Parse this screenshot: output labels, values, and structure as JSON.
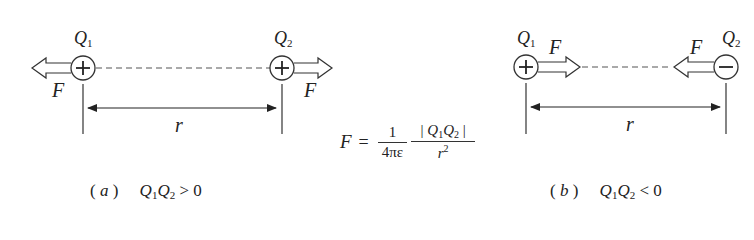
{
  "figure": {
    "panel_a": {
      "caption_label": "a",
      "condition_lhs": "Q",
      "condition_op": ">",
      "condition_rhs": "0",
      "charge1": {
        "name": "Q",
        "sub": "1",
        "sign": "+"
      },
      "charge2": {
        "name": "Q",
        "sub": "2",
        "sign": "+"
      },
      "force_label": "F",
      "distance_label": "r",
      "force_direction": "repulsive (outward)"
    },
    "panel_b": {
      "caption_label": "b",
      "condition_op": "<",
      "condition_rhs": "0",
      "charge1": {
        "name": "Q",
        "sub": "1",
        "sign": "+"
      },
      "charge2": {
        "name": "Q",
        "sub": "2",
        "sign": "−"
      },
      "force_label": "F",
      "distance_label": "r",
      "force_direction": "attractive (inward)"
    },
    "formula": {
      "lhs": "F",
      "eq": "=",
      "numerator1": "1",
      "denominator1": "4πε",
      "numerator2_open": "| ",
      "numerator2_q": "Q",
      "numerator2_sub1": "1",
      "numerator2_sub2": "2",
      "numerator2_close": " |",
      "denominator2": "r",
      "denominator2_exp": "2"
    },
    "colors": {
      "stroke": "#333333",
      "text": "#222222",
      "background": "#ffffff"
    }
  }
}
